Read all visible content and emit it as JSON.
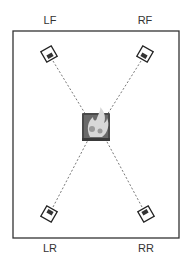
{
  "diagram": {
    "type": "speaker-placement",
    "room": {
      "x": 13,
      "y": 31,
      "width": 166,
      "height": 207,
      "stroke": "#333333"
    },
    "listener": {
      "x": 96,
      "y": 127,
      "size": 28,
      "fill": "#555555"
    },
    "speakers": [
      {
        "id": "lf",
        "label": "LF",
        "x": 49,
        "y": 54,
        "rotation": -30,
        "label_x": 50,
        "label_y": 14
      },
      {
        "id": "rf",
        "label": "RF",
        "x": 145,
        "y": 54,
        "rotation": 30,
        "label_x": 145,
        "label_y": 14
      },
      {
        "id": "lr",
        "label": "LR",
        "x": 49,
        "y": 214,
        "rotation": 30,
        "label_x": 50,
        "label_y": 242
      },
      {
        "id": "rr",
        "label": "RR",
        "x": 146,
        "y": 214,
        "rotation": -30,
        "label_x": 146,
        "label_y": 242
      }
    ],
    "line_color": "#555555"
  }
}
